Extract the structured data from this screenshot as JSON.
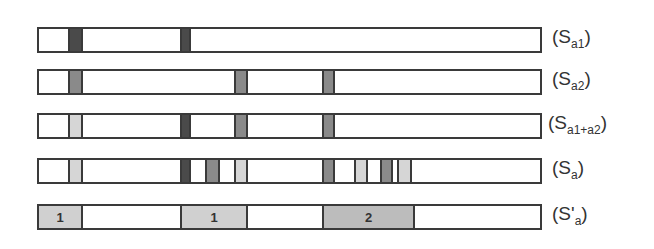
{
  "rows": [
    {
      "label_main": "S",
      "label_sub": "a1",
      "top": 27,
      "segments": [
        {
          "x": 29,
          "w": 15,
          "shade": "dark"
        },
        {
          "x": 141,
          "w": 11,
          "shade": "dark"
        }
      ]
    },
    {
      "label_main": "S",
      "label_sub": "a2",
      "top": 69,
      "segments": [
        {
          "x": 29,
          "w": 15,
          "shade": "mid"
        },
        {
          "x": 195,
          "w": 14,
          "shade": "mid"
        },
        {
          "x": 283,
          "w": 13,
          "shade": "mid"
        }
      ]
    },
    {
      "label_main": "S",
      "label_sub": "a1+a2",
      "top": 113,
      "segments": [
        {
          "x": 29,
          "w": 15,
          "shade": "light"
        },
        {
          "x": 141,
          "w": 11,
          "shade": "dark"
        },
        {
          "x": 195,
          "w": 14,
          "shade": "mid"
        },
        {
          "x": 283,
          "w": 13,
          "shade": "mid"
        }
      ]
    },
    {
      "label_main": "S",
      "label_sub": "a",
      "top": 158,
      "segments": [
        {
          "x": 29,
          "w": 15,
          "shade": "light"
        },
        {
          "x": 141,
          "w": 11,
          "shade": "dark"
        },
        {
          "x": 166,
          "w": 15,
          "shade": "mid"
        },
        {
          "x": 195,
          "w": 14,
          "shade": "light"
        },
        {
          "x": 283,
          "w": 13,
          "shade": "mid"
        },
        {
          "x": 315,
          "w": 14,
          "shade": "light"
        },
        {
          "x": 341,
          "w": 13,
          "shade": "mid"
        },
        {
          "x": 358,
          "w": 15,
          "shade": "light"
        }
      ]
    },
    {
      "label_main": "S'",
      "label_sub": "a",
      "top": 204,
      "blocks": [
        {
          "x": 0,
          "w": 44,
          "text": "1"
        },
        {
          "x": 141,
          "w": 68,
          "text": "1"
        },
        {
          "x": 283,
          "w": 93,
          "text": "2"
        }
      ]
    }
  ],
  "labels": {
    "r0": {
      "open": "(",
      "main": "S",
      "sub": "a1",
      "close": ")"
    },
    "r1": {
      "open": "(",
      "main": "S",
      "sub": "a2",
      "close": ")"
    },
    "r2": {
      "open": "(",
      "main": "S",
      "sub": "a1+a2",
      "close": ")"
    },
    "r3": {
      "open": "(",
      "main": "S",
      "sub": "a",
      "close": ")"
    },
    "r4": {
      "open": "(",
      "main": "S'",
      "sub": "a",
      "close": ")"
    }
  },
  "blocks_text": {
    "b0": "1",
    "b1": "1",
    "b2": "2"
  },
  "colors": {
    "border": "#3a3a3a",
    "dark": "#4a4a4a",
    "mid": "#8a8a8a",
    "light": "#d6d6d6",
    "block": "#c2c2c2"
  }
}
